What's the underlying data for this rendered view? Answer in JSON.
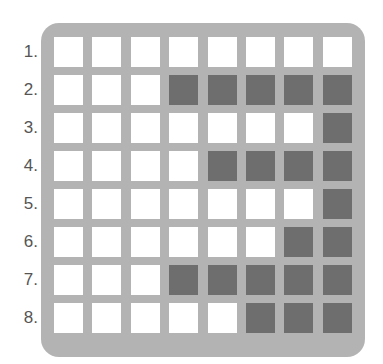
{
  "grid": {
    "row_labels": [
      "1.",
      "2.",
      "3.",
      "4.",
      "5.",
      "6.",
      "7.",
      "8."
    ],
    "rows": [
      [
        0,
        0,
        0,
        0,
        0,
        0,
        0,
        0
      ],
      [
        0,
        0,
        0,
        1,
        1,
        1,
        1,
        1
      ],
      [
        0,
        0,
        0,
        0,
        0,
        0,
        0,
        1
      ],
      [
        0,
        0,
        0,
        0,
        1,
        1,
        1,
        1
      ],
      [
        0,
        0,
        0,
        0,
        0,
        0,
        0,
        1
      ],
      [
        0,
        0,
        0,
        0,
        0,
        0,
        1,
        1
      ],
      [
        0,
        0,
        0,
        1,
        1,
        1,
        1,
        1
      ],
      [
        0,
        0,
        0,
        0,
        0,
        1,
        1,
        1
      ]
    ],
    "colors": {
      "board": "#b3b3b3",
      "filled": "#6e6e6e",
      "empty": "#ffffff",
      "label": "#555555"
    }
  }
}
